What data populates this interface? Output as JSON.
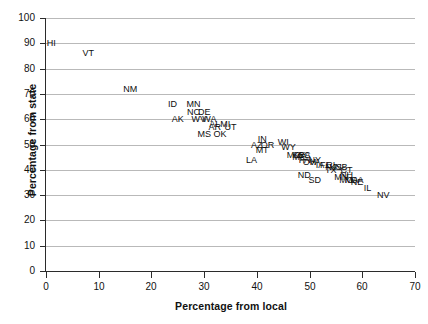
{
  "chart_data": {
    "type": "scatter",
    "title": "",
    "xlabel": "Percentage from local",
    "ylabel": "Percentage from state",
    "xlim": [
      0,
      70
    ],
    "ylim": [
      0,
      100
    ],
    "xticks": [
      0,
      10,
      20,
      30,
      40,
      50,
      60,
      70
    ],
    "yticks": [
      0,
      10,
      20,
      30,
      40,
      50,
      60,
      70,
      80,
      90,
      100
    ],
    "grid": "horizontal",
    "legend": "none",
    "marker_style": "text-labels-only",
    "points": [
      {
        "label": "HI",
        "x": 1,
        "y": 90
      },
      {
        "label": "VT",
        "x": 8,
        "y": 86
      },
      {
        "label": "NM",
        "x": 16,
        "y": 72
      },
      {
        "label": "ID",
        "x": 24,
        "y": 66
      },
      {
        "label": "MN",
        "x": 28,
        "y": 66
      },
      {
        "label": "NC",
        "x": 28,
        "y": 63
      },
      {
        "label": "DE",
        "x": 30,
        "y": 63
      },
      {
        "label": "AK",
        "x": 25,
        "y": 60
      },
      {
        "label": "WV",
        "x": 29,
        "y": 60
      },
      {
        "label": "WA",
        "x": 31,
        "y": 60
      },
      {
        "label": "AL",
        "x": 32,
        "y": 58
      },
      {
        "label": "AR",
        "x": 32,
        "y": 57
      },
      {
        "label": "MI",
        "x": 34,
        "y": 58
      },
      {
        "label": "UT",
        "x": 35,
        "y": 57
      },
      {
        "label": "OK",
        "x": 33,
        "y": 54
      },
      {
        "label": "MS",
        "x": 30,
        "y": 54
      },
      {
        "label": "AZ",
        "x": 40,
        "y": 50
      },
      {
        "label": "IN",
        "x": 41,
        "y": 52
      },
      {
        "label": "OR",
        "x": 42,
        "y": 50
      },
      {
        "label": "MT",
        "x": 41,
        "y": 48
      },
      {
        "label": "WI",
        "x": 45,
        "y": 51
      },
      {
        "label": "WY",
        "x": 46,
        "y": 49
      },
      {
        "label": "LA",
        "x": 39,
        "y": 44
      },
      {
        "label": "MD",
        "x": 47,
        "y": 46
      },
      {
        "label": "ME",
        "x": 48,
        "y": 45
      },
      {
        "label": "KY",
        "x": 48,
        "y": 46
      },
      {
        "label": "SC",
        "x": 49,
        "y": 46
      },
      {
        "label": "PA",
        "x": 49,
        "y": 44
      },
      {
        "label": "CA",
        "x": 49,
        "y": 46
      },
      {
        "label": "NY",
        "x": 51,
        "y": 44
      },
      {
        "label": "OH",
        "x": 50,
        "y": 43
      },
      {
        "label": "VA",
        "x": 51,
        "y": 43
      },
      {
        "label": "IA",
        "x": 52,
        "y": 42
      },
      {
        "label": "FL",
        "x": 53,
        "y": 42
      },
      {
        "label": "RI",
        "x": 54,
        "y": 42
      },
      {
        "label": "NJ",
        "x": 54,
        "y": 41
      },
      {
        "label": "KS",
        "x": 55,
        "y": 41
      },
      {
        "label": "TX",
        "x": 54,
        "y": 40
      },
      {
        "label": "NB",
        "x": 56,
        "y": 41
      },
      {
        "label": "ND",
        "x": 49,
        "y": 38
      },
      {
        "label": "SD",
        "x": 51,
        "y": 36
      },
      {
        "label": "CT",
        "x": 57,
        "y": 40
      },
      {
        "label": "NH",
        "x": 57,
        "y": 38
      },
      {
        "label": "MN2",
        "x": 56,
        "y": 37
      },
      {
        "label": "MO",
        "x": 57,
        "y": 36
      },
      {
        "label": "MA",
        "x": 58,
        "y": 36
      },
      {
        "label": "NE",
        "x": 59,
        "y": 35
      },
      {
        "label": "GA",
        "x": 59,
        "y": 36
      },
      {
        "label": "IL",
        "x": 61,
        "y": 33
      },
      {
        "label": "NV",
        "x": 64,
        "y": 30
      }
    ]
  }
}
